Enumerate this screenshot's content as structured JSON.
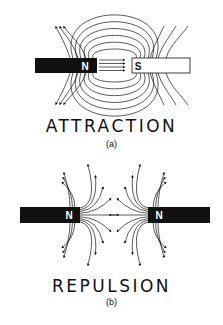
{
  "figure": {
    "panels": [
      {
        "id": "a",
        "title": "ATTRACTION",
        "sublabel": "(a)",
        "left_magnet": {
          "pole": "N",
          "color": "#111111"
        },
        "right_magnet": {
          "pole": "S",
          "color": "#ffffff"
        }
      },
      {
        "id": "b",
        "title": "REPULSION",
        "sublabel": "(b)",
        "left_magnet": {
          "pole": "N",
          "color": "#111111"
        },
        "right_magnet": {
          "pole": "N",
          "color": "#111111"
        }
      }
    ],
    "colors": {
      "ink": "#111111",
      "background": "#ffffff"
    }
  }
}
